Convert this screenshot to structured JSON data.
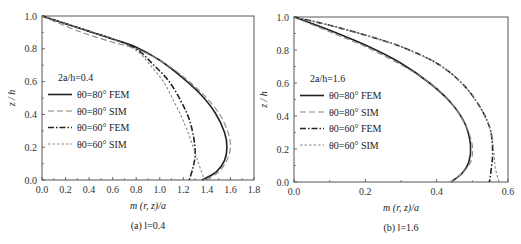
{
  "chart_data": [
    {
      "type": "line",
      "caption": "(a) l=0.4",
      "xlabel": "m (r, z)/a",
      "ylabel": "z / h",
      "xlim": [
        0,
        1.8
      ],
      "ylim": [
        0,
        1.0
      ],
      "xticks": [
        "0.0",
        "0.2",
        "0.4",
        "0.6",
        "0.8",
        "1.0",
        "1.2",
        "1.4",
        "1.6",
        "1.8"
      ],
      "yticks": [
        "0.0",
        "0.2",
        "0.4",
        "0.6",
        "0.8",
        "1.0"
      ],
      "annotation": "2a/h=0.4",
      "grid": false,
      "legend_position": "inside-left-middle",
      "series": [
        {
          "name": "θ0=80° FEM",
          "style": "solid",
          "color": "#222222",
          "x": [
            0.0,
            0.3,
            0.6,
            0.8,
            1.0,
            1.2,
            1.35,
            1.47,
            1.55,
            1.57,
            1.55,
            1.48,
            1.36
          ],
          "y": [
            1.0,
            0.93,
            0.86,
            0.81,
            0.73,
            0.62,
            0.52,
            0.41,
            0.29,
            0.2,
            0.12,
            0.05,
            0.0
          ]
        },
        {
          "name": "θ0=80° SIM",
          "style": "dashed",
          "color": "#888888",
          "x": [
            0.0,
            0.3,
            0.6,
            0.8,
            1.0,
            1.2,
            1.37,
            1.5,
            1.58,
            1.6,
            1.57,
            1.5,
            1.4
          ],
          "y": [
            1.0,
            0.91,
            0.84,
            0.8,
            0.73,
            0.63,
            0.52,
            0.41,
            0.29,
            0.2,
            0.12,
            0.05,
            0.0
          ]
        },
        {
          "name": "θ0=60° FEM",
          "style": "dashdot",
          "color": "#222222",
          "x": [
            0.0,
            0.3,
            0.6,
            0.8,
            0.95,
            1.08,
            1.18,
            1.25,
            1.29,
            1.3,
            1.28,
            1.25
          ],
          "y": [
            1.0,
            0.93,
            0.86,
            0.8,
            0.7,
            0.6,
            0.48,
            0.37,
            0.25,
            0.15,
            0.07,
            0.0
          ]
        },
        {
          "name": "θ0=60° SIM",
          "style": "dotted",
          "color": "#888888",
          "x": [
            0.0,
            0.3,
            0.6,
            0.8,
            0.92,
            1.03,
            1.12,
            1.2,
            1.27,
            1.33,
            1.38
          ],
          "y": [
            1.0,
            0.93,
            0.86,
            0.79,
            0.7,
            0.6,
            0.48,
            0.36,
            0.23,
            0.1,
            0.0
          ]
        }
      ]
    },
    {
      "type": "line",
      "caption": "(b) l=1.6",
      "xlabel": "m (r, z)/a",
      "ylabel": "z / h",
      "xlim": [
        0,
        0.6
      ],
      "ylim": [
        0,
        1.0
      ],
      "xticks": [
        "0.0",
        "0.2",
        "0.4",
        "0.6"
      ],
      "yticks": [
        "0.0",
        "0.2",
        "0.4",
        "0.6",
        "0.8",
        "1.0"
      ],
      "annotation": "2a/h=1.6",
      "grid": false,
      "legend_position": "inside-left-middle",
      "series": [
        {
          "name": "θ0=80° FEM",
          "style": "solid",
          "color": "#222222",
          "x": [
            0.0,
            0.1,
            0.2,
            0.3,
            0.38,
            0.44,
            0.48,
            0.495,
            0.49,
            0.47,
            0.44
          ],
          "y": [
            1.0,
            0.92,
            0.83,
            0.72,
            0.6,
            0.48,
            0.35,
            0.22,
            0.12,
            0.05,
            0.0
          ]
        },
        {
          "name": "θ0=80° SIM",
          "style": "dashed",
          "color": "#888888",
          "x": [
            0.0,
            0.1,
            0.2,
            0.3,
            0.38,
            0.44,
            0.48,
            0.5,
            0.495,
            0.47,
            0.44
          ],
          "y": [
            1.0,
            0.91,
            0.82,
            0.71,
            0.6,
            0.48,
            0.35,
            0.22,
            0.12,
            0.05,
            0.0
          ]
        },
        {
          "name": "θ0=60° FEM",
          "style": "dashdot",
          "color": "#222222",
          "x": [
            0.0,
            0.1,
            0.2,
            0.3,
            0.4,
            0.47,
            0.52,
            0.55,
            0.557,
            0.553,
            0.548
          ],
          "y": [
            1.0,
            0.95,
            0.89,
            0.82,
            0.72,
            0.6,
            0.46,
            0.32,
            0.18,
            0.08,
            0.0
          ]
        },
        {
          "name": "θ0=60° SIM",
          "style": "dotted",
          "color": "#888888",
          "x": [
            0.0,
            0.1,
            0.2,
            0.3,
            0.4,
            0.47,
            0.52,
            0.55,
            0.56,
            0.565,
            0.575
          ],
          "y": [
            1.0,
            0.95,
            0.89,
            0.82,
            0.72,
            0.6,
            0.46,
            0.32,
            0.18,
            0.08,
            0.0
          ]
        }
      ]
    }
  ]
}
